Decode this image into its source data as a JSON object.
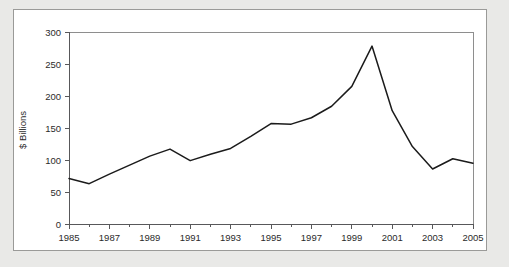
{
  "figure": {
    "panel_background": "#ffffff",
    "page_background": "#e9e9e7",
    "border_color": "#9a9a98"
  },
  "chart_data": {
    "type": "line",
    "title": "",
    "subtitle": "",
    "xlabel": "",
    "ylabel": "$ Billions",
    "xlim": [
      1985,
      2005
    ],
    "ylim": [
      0,
      300
    ],
    "grid": false,
    "legend": null,
    "line_color": "#1b1b1b",
    "x": [
      1985,
      1986,
      1987,
      1988,
      1989,
      1990,
      1991,
      1992,
      1993,
      1994,
      1995,
      1996,
      1997,
      1998,
      1999,
      2000,
      2001,
      2002,
      2003,
      2004,
      2005
    ],
    "values": [
      71,
      63,
      78,
      92,
      106,
      117,
      99,
      109,
      118,
      137,
      157,
      156,
      166,
      184,
      215,
      278,
      177,
      121,
      86,
      102,
      95
    ],
    "series": [
      {
        "name": "$ Billions",
        "values": [
          71,
          63,
          78,
          92,
          106,
          117,
          99,
          109,
          118,
          137,
          157,
          156,
          166,
          184,
          215,
          278,
          177,
          121,
          86,
          102,
          95
        ]
      }
    ],
    "y_ticks": [
      0,
      50,
      100,
      150,
      200,
      250,
      300
    ],
    "y_tick_labels": [
      "0",
      "50",
      "100",
      "150",
      "200",
      "250",
      "300"
    ],
    "x_major_ticks": [
      1985,
      1987,
      1989,
      1991,
      1993,
      1995,
      1997,
      1999,
      2001,
      2003,
      2005
    ],
    "x_major_tick_labels": [
      "1985",
      "1987",
      "1989",
      "1991",
      "1993",
      "1995",
      "1997",
      "1999",
      "2001",
      "2003",
      "2005"
    ],
    "x_minor_ticks": [
      1986,
      1988,
      1990,
      1992,
      1994,
      1996,
      1998,
      2000,
      2002,
      2004
    ]
  }
}
